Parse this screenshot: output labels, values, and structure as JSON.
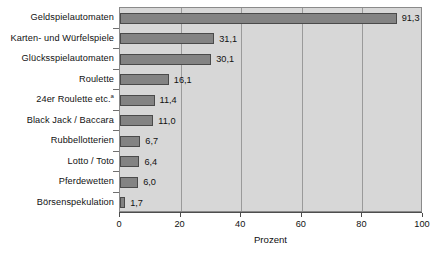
{
  "chart_data": {
    "type": "bar",
    "orientation": "horizontal",
    "title": "",
    "xlabel": "Prozent",
    "ylabel": "",
    "xlim": [
      0,
      100
    ],
    "xticks": [
      0,
      20,
      40,
      60,
      80,
      100
    ],
    "xtick_labels": [
      "0",
      "20",
      "40",
      "60",
      "80",
      "100"
    ],
    "gridlines": [
      20,
      40,
      60,
      80
    ],
    "grid": true,
    "legend": null,
    "categories": [
      "Geldspielautomaten",
      "Karten- und Würfelspiele",
      "Glücksspielautomaten",
      "Roulette",
      "24er Roulette etc.",
      "Black Jack / Baccara",
      "Rubbellotterien",
      "Lotto / Toto",
      "Pferdewetten",
      "Börsenspekulation"
    ],
    "category_footnotes": [
      "",
      "",
      "",
      "",
      "a",
      "",
      "",
      "",
      "",
      ""
    ],
    "values": [
      91.3,
      31.1,
      30.1,
      16.1,
      11.4,
      11.0,
      6.7,
      6.4,
      6.0,
      1.7
    ],
    "value_labels": [
      "91,3",
      "31,1",
      "30,1",
      "16,1",
      "11,4",
      "11,0",
      "6,7",
      "6,4",
      "6,0",
      "1,7"
    ],
    "colors": {
      "bar_fill": "#838383",
      "bar_border": "#4a4a4a",
      "plot_background": "#d7d7d7",
      "gridline": "#9a9a9a",
      "axis": "#4d4d4d",
      "text": "#111111",
      "page_background": "#ffffff"
    }
  }
}
